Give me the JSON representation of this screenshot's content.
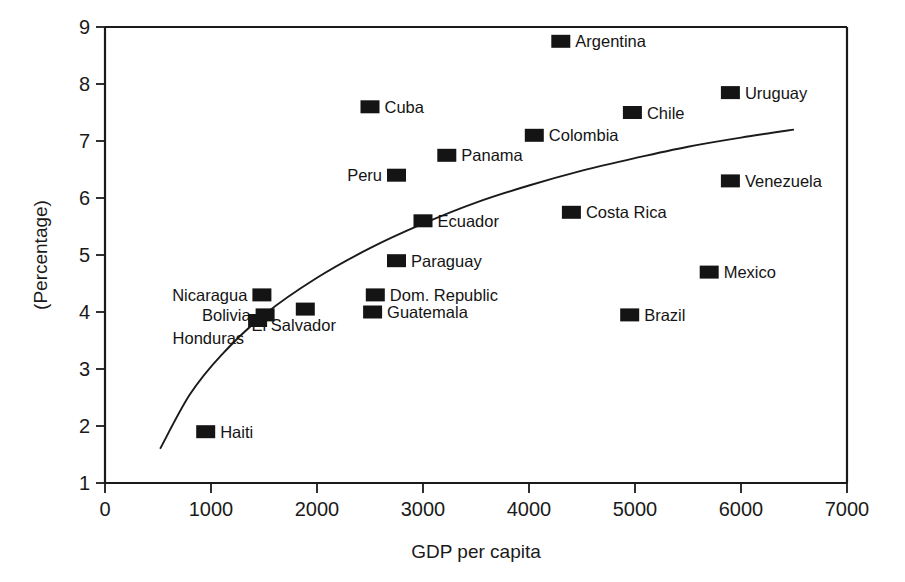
{
  "chart_data": {
    "type": "scatter",
    "title": "",
    "xlabel": "GDP per capita",
    "ylabel": "(Percentage)",
    "xlim": [
      0,
      7000
    ],
    "ylim": [
      1,
      9
    ],
    "xticks": [
      0,
      1000,
      2000,
      3000,
      4000,
      5000,
      6000,
      7000
    ],
    "yticks": [
      1,
      2,
      3,
      4,
      5,
      6,
      7,
      8,
      9
    ],
    "xtick_labels": [
      "0",
      "1000",
      "2000",
      "3000",
      "4000",
      "5000",
      "6000",
      "7000"
    ],
    "ytick_labels": [
      "1",
      "2",
      "3",
      "4",
      "5",
      "6",
      "7",
      "8",
      "9"
    ],
    "grid": false,
    "legend": "none",
    "marker_style": "filled-square",
    "marker_color": "#141414",
    "points": [
      {
        "label": "Argentina",
        "x": 4300,
        "y": 8.75,
        "label_side": "right"
      },
      {
        "label": "Uruguay",
        "x": 5900,
        "y": 7.85,
        "label_side": "right"
      },
      {
        "label": "Cuba",
        "x": 2500,
        "y": 7.6,
        "label_side": "right"
      },
      {
        "label": "Chile",
        "x": 4975,
        "y": 7.5,
        "label_side": "right"
      },
      {
        "label": "Colombia",
        "x": 4050,
        "y": 7.1,
        "label_side": "right"
      },
      {
        "label": "Panama",
        "x": 3225,
        "y": 6.75,
        "label_side": "right"
      },
      {
        "label": "Peru",
        "x": 2750,
        "y": 6.4,
        "label_side": "left"
      },
      {
        "label": "Venezuela",
        "x": 5900,
        "y": 6.3,
        "label_side": "right"
      },
      {
        "label": "Costa Rica",
        "x": 4400,
        "y": 5.75,
        "label_side": "right"
      },
      {
        "label": "Ecuador",
        "x": 3000,
        "y": 5.6,
        "label_side": "right"
      },
      {
        "label": "Paraguay",
        "x": 2750,
        "y": 4.9,
        "label_side": "right"
      },
      {
        "label": "Mexico",
        "x": 5700,
        "y": 4.7,
        "label_side": "right"
      },
      {
        "label": "Nicaragua",
        "x": 1480,
        "y": 4.3,
        "label_side": "left"
      },
      {
        "label": "Dom. Republic",
        "x": 2550,
        "y": 4.3,
        "label_side": "right"
      },
      {
        "label": "El Salvador",
        "x": 1890,
        "y": 4.05,
        "label_side": "below"
      },
      {
        "label": "Guatemala",
        "x": 2525,
        "y": 4.0,
        "label_side": "right"
      },
      {
        "label": "Brazil",
        "x": 4950,
        "y": 3.95,
        "label_side": "right"
      },
      {
        "label": "Bolivia",
        "x": 1510,
        "y": 3.95,
        "label_side": "left"
      },
      {
        "label": "Honduras",
        "x": 1440,
        "y": 3.85,
        "label_side": "belowleft"
      },
      {
        "label": "Haiti",
        "x": 950,
        "y": 1.9,
        "label_side": "right"
      }
    ],
    "trend_line": {
      "description": "logarithmic fit curve",
      "points": [
        {
          "x": 520,
          "y": 1.6
        },
        {
          "x": 800,
          "y": 2.55
        },
        {
          "x": 1100,
          "y": 3.25
        },
        {
          "x": 1500,
          "y": 3.95
        },
        {
          "x": 2000,
          "y": 4.6
        },
        {
          "x": 2500,
          "y": 5.12
        },
        {
          "x": 3000,
          "y": 5.55
        },
        {
          "x": 3500,
          "y": 5.92
        },
        {
          "x": 4000,
          "y": 6.22
        },
        {
          "x": 4500,
          "y": 6.48
        },
        {
          "x": 5000,
          "y": 6.7
        },
        {
          "x": 5500,
          "y": 6.9
        },
        {
          "x": 6000,
          "y": 7.06
        },
        {
          "x": 6500,
          "y": 7.2
        }
      ]
    }
  }
}
